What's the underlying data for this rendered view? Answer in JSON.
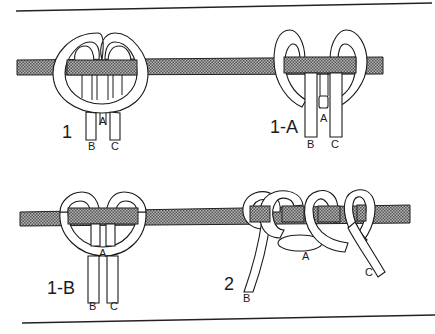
{
  "figure": {
    "type": "knot-tying illustration",
    "colors": {
      "ink": "#1a1a1a",
      "rope_fill": "#9a9a9a",
      "background": "#ffffff"
    },
    "panels": [
      {
        "id": "1",
        "label": "1",
        "strand_labels": [
          "A",
          "B",
          "C"
        ]
      },
      {
        "id": "1-A",
        "label": "1-A",
        "strand_labels": [
          "A",
          "B",
          "C"
        ]
      },
      {
        "id": "1-B",
        "label": "1-B",
        "strand_labels": [
          "A",
          "B",
          "C"
        ]
      },
      {
        "id": "2",
        "label": "2",
        "strand_labels": [
          "A",
          "B",
          "C"
        ]
      }
    ]
  }
}
